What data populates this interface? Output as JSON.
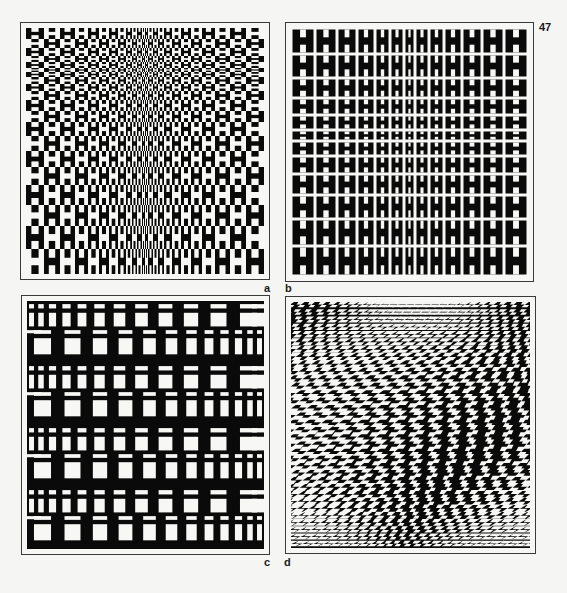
{
  "page": {
    "page_number": "47",
    "background_color": "#f5f5f3",
    "ink_color": "#0a0a0a",
    "paper_color": "#f7f7f5"
  },
  "figures": [
    {
      "id": "a",
      "label": "a",
      "description": "Alternating positive/negative H-shaped cells; column widths shrink toward center, row heights shrink toward top",
      "pattern": "alternating-h-grid",
      "columns": 24,
      "rows": 20
    },
    {
      "id": "b",
      "label": "b",
      "description": "Grid of black H shapes separated by white gaps; columns narrow toward center, rows compress near middle",
      "pattern": "h-grid",
      "columns": 13,
      "rows": 12
    },
    {
      "id": "c",
      "label": "c",
      "description": "Black field with white window-like rectangles; alternating rows with columns growing left-to-right or shrinking",
      "pattern": "window-grid",
      "columns": 12,
      "row_groups": 4
    },
    {
      "id": "d",
      "label": "d",
      "description": "Distorted zigzag houndstooth-like pattern with curving bands",
      "pattern": "zigzag-warp",
      "columns": 22,
      "rows": 34
    }
  ]
}
